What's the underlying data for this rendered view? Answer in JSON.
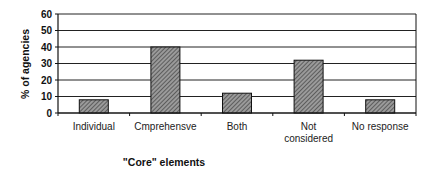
{
  "chart_data": {
    "type": "bar",
    "title": "",
    "xlabel": "\"Core\" elements",
    "ylabel": "% of agencies",
    "categories": [
      "Individual",
      "Cmprehensve",
      "Both",
      "Not considered",
      "No response"
    ],
    "category_lines": [
      [
        "Individual"
      ],
      [
        "Cmprehensve"
      ],
      [
        "Both"
      ],
      [
        "Not",
        "considered"
      ],
      [
        "No response"
      ]
    ],
    "values": [
      8,
      40,
      12,
      32,
      8
    ],
    "ylim": [
      0,
      60
    ],
    "yticks": [
      0,
      10,
      20,
      30,
      40,
      50,
      60
    ],
    "grid": true,
    "legend": null,
    "bar_fill": "hatched gray",
    "colors": {
      "bar": "#8a8a8a",
      "hatch": "#3a3a3a",
      "outline": "#111111",
      "grid": "#222222"
    }
  }
}
